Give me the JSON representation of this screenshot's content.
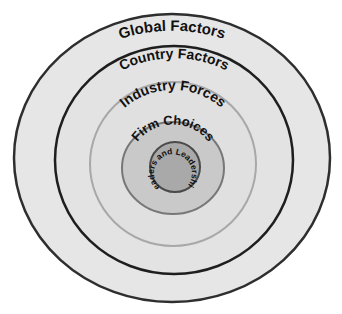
{
  "diagram": {
    "type": "concentric-circles",
    "rings": [
      {
        "id": "global",
        "label": "Global Factors",
        "fill": "#e6e6e6",
        "stroke": "#2e2e2e"
      },
      {
        "id": "country",
        "label": "Country Factors",
        "fill": "#e3e3e3",
        "stroke": "#1e1e1e"
      },
      {
        "id": "industry",
        "label": "Industry Forces",
        "fill": "#e0e0e0",
        "stroke": "#a8a8a8"
      },
      {
        "id": "firm",
        "label": "Firm Choices",
        "fill": "#c9c9c9",
        "stroke": "#777777"
      },
      {
        "id": "leaders",
        "label": "Leaders and Leadership",
        "fill": "#a9a9a9",
        "stroke": "#4a4a4a"
      }
    ]
  }
}
